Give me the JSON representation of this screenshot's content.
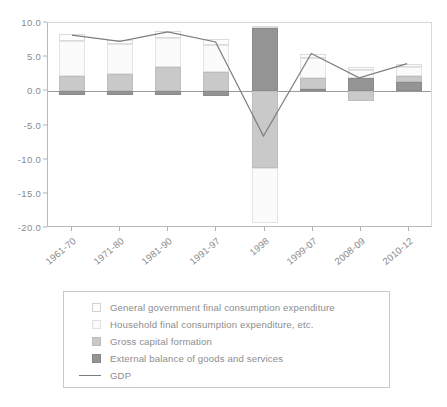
{
  "chart_data": {
    "type": "bar",
    "subtype": "stacked-bar-with-line-overlay",
    "title": "",
    "xlabel": "",
    "ylabel": "",
    "ylim": [
      -20.0,
      10.0
    ],
    "yticks": [
      10.0,
      5.0,
      0.0,
      -5.0,
      -10.0,
      -15.0,
      -20.0
    ],
    "ytick_labels": [
      "10.0",
      "5.0",
      "0.0",
      "-5.0",
      "-10.0",
      "-15.0",
      "-20.0"
    ],
    "grid": false,
    "legend_position": "below-plot",
    "categories": [
      "1961-70",
      "1971-80",
      "1981-90",
      "1991-97",
      "1998",
      "1999-07",
      "2008-09",
      "2010-12"
    ],
    "series": [
      {
        "name": "General government final consumption expenditure",
        "color": "#fdfdfd",
        "values": [
          1.1,
          0.6,
          1.0,
          0.9,
          0.4,
          0.5,
          0.5,
          0.4
        ]
      },
      {
        "name": "Household final consumption expenditure, etc.",
        "color": "#fbfbfb",
        "values": [
          5.1,
          4.3,
          4.3,
          4.0,
          -8.0,
          2.9,
          1.1,
          1.3
        ]
      },
      {
        "name": "Gross capital formation",
        "color": "#c9c9c9",
        "values": [
          2.2,
          2.6,
          3.5,
          2.8,
          -11.2,
          1.7,
          -1.4,
          0.9
        ]
      },
      {
        "name": "External balance of goods and services",
        "color": "#949494",
        "values": [
          -0.5,
          -0.5,
          -0.5,
          -0.7,
          9.2,
          0.3,
          2.0,
          1.4
        ]
      }
    ],
    "line_series": {
      "name": "GDP",
      "color": "#7d7d7d",
      "values": [
        8.2,
        7.3,
        8.7,
        7.2,
        -6.7,
        5.5,
        1.9,
        4.0
      ]
    }
  },
  "legend": {
    "items": [
      {
        "label": "General government final consumption expenditure",
        "swatch": "legend-swatch-general-government"
      },
      {
        "label": "Household final consumption expenditure, etc.",
        "swatch": "legend-swatch-household"
      },
      {
        "label": "Gross capital formation",
        "swatch": "legend-swatch-gross-capital"
      },
      {
        "label": "External balance of goods and services",
        "swatch": "legend-swatch-external-balance"
      },
      {
        "label": "GDP",
        "swatch": "legend-line-gdp"
      }
    ]
  }
}
